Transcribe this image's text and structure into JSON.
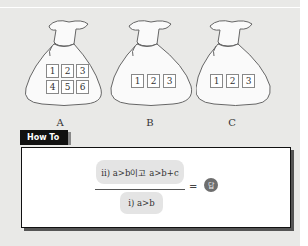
{
  "header": {
    "cropped_text": "…"
  },
  "bags": [
    {
      "label": "A",
      "cards": [
        "1",
        "2",
        "3",
        "4",
        "5",
        "6"
      ]
    },
    {
      "label": "B",
      "cards": [
        "1",
        "2",
        "3"
      ]
    },
    {
      "label": "C",
      "cards": [
        "1",
        "2",
        "3"
      ]
    }
  ],
  "howto": {
    "tab_label": "How To",
    "numerator": "ii) a>b이고 a>b+c",
    "denominator": "i) a>b",
    "equals": "=",
    "answer_icon": "답"
  },
  "colors": {
    "page_bg": "#e9e9e7",
    "tab_bg": "#111111",
    "pill_bg": "#e4e4e4",
    "answer_badge": "#6e6e6e"
  }
}
